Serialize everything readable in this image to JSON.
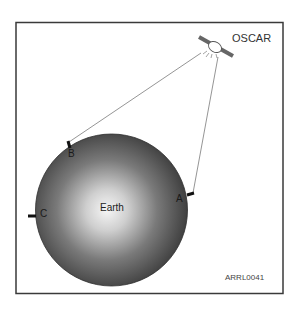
{
  "diagram": {
    "satellite": {
      "label": "OSCAR",
      "icon": "satellite-icon"
    },
    "planet": {
      "label": "Earth"
    },
    "stations": [
      {
        "id": "A",
        "label": "A"
      },
      {
        "id": "B",
        "label": "B"
      },
      {
        "id": "C",
        "label": "C"
      }
    ],
    "figure_code": "ARRL0041",
    "colors": {
      "frame": "#3a3a3a",
      "earth_center": "#f4f4f4",
      "earth_edge": "#3c3c3c",
      "line": "#777777",
      "marker": "#111111"
    }
  }
}
